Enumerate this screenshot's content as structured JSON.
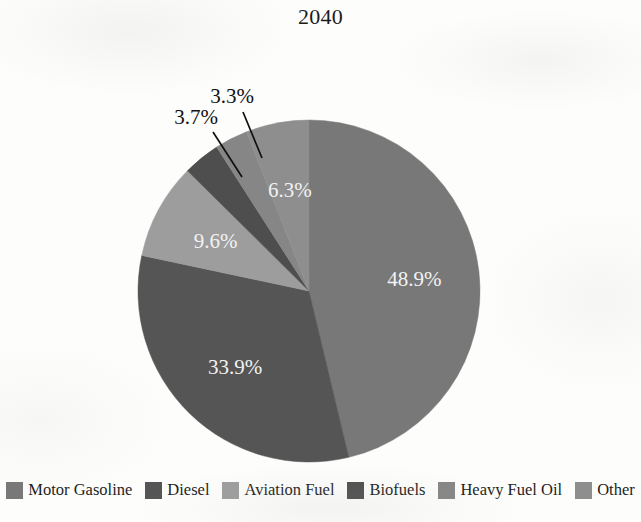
{
  "chart_data": {
    "type": "pie",
    "title": "2040",
    "xlabel": "",
    "ylabel": "",
    "legend_position": "bottom",
    "grid": false,
    "units": "percent",
    "start_angle_deg": 0,
    "direction": "clockwise",
    "categories": [
      "Motor Gasoline",
      "Diesel",
      "Aviation Fuel",
      "Biofuels",
      "Heavy Fuel Oil",
      "Other"
    ],
    "values": [
      48.9,
      33.9,
      9.6,
      3.7,
      3.3,
      6.3
    ],
    "value_labels": [
      "48.9%",
      "33.9%",
      "9.6%",
      "3.7%",
      "3.3%",
      "6.3%"
    ],
    "label_placement": [
      "inside",
      "inside",
      "inside",
      "outside",
      "outside",
      "inside"
    ],
    "colors": [
      "#787878",
      "#555555",
      "#9d9d9d",
      "#4e4e4e",
      "#868686",
      "#8e8e8e"
    ],
    "slices": [
      {
        "label": "Motor Gasoline",
        "value": 48.9,
        "value_label": "48.9%",
        "color": "#787878",
        "placement": "inside"
      },
      {
        "label": "Diesel",
        "value": 33.9,
        "value_label": "33.9%",
        "color": "#555555",
        "placement": "inside"
      },
      {
        "label": "Aviation Fuel",
        "value": 9.6,
        "value_label": "9.6%",
        "color": "#9d9d9d",
        "placement": "inside"
      },
      {
        "label": "Biofuels",
        "value": 3.7,
        "value_label": "3.7%",
        "color": "#4e4e4e",
        "placement": "outside"
      },
      {
        "label": "Heavy Fuel Oil",
        "value": 3.3,
        "value_label": "3.3%",
        "color": "#868686",
        "placement": "outside"
      },
      {
        "label": "Other",
        "value": 6.3,
        "value_label": "6.3%",
        "color": "#8e8e8e",
        "placement": "inside"
      }
    ]
  },
  "title": {
    "text": "2040"
  },
  "legend": {
    "items": [
      {
        "label": "Motor Gasoline",
        "color": "#787878"
      },
      {
        "label": "Diesel",
        "color": "#555555"
      },
      {
        "label": "Aviation Fuel",
        "color": "#9d9d9d"
      },
      {
        "label": "Biofuels",
        "color": "#4e4e4e"
      },
      {
        "label": "Heavy Fuel Oil",
        "color": "#868686"
      },
      {
        "label": "Other",
        "color": "#8e8e8e"
      }
    ]
  },
  "geometry": {
    "center_x": 309,
    "center_y": 291,
    "radius": 171
  }
}
